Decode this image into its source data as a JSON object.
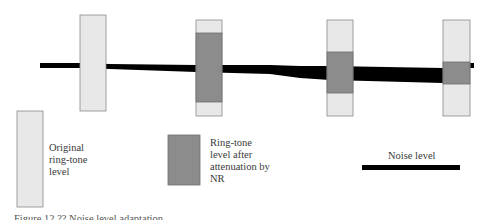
{
  "diagram": {
    "colors": {
      "original_fill": "#e8e8e8",
      "original_stroke": "#8a8a8a",
      "attenuated_fill": "#8c8c8c",
      "attenuated_stroke": "#6e6e6e",
      "noise": "#000000"
    },
    "stages": [
      {
        "id": "stage-1",
        "original_level": 1.0,
        "attenuated_level": null,
        "noise_thickness": "thin"
      },
      {
        "id": "stage-2",
        "original_level": 1.0,
        "attenuated_level": 0.72,
        "noise_thickness": "medium"
      },
      {
        "id": "stage-3",
        "original_level": 1.0,
        "attenuated_level": 0.42,
        "noise_thickness": "thick"
      },
      {
        "id": "stage-4",
        "original_level": 1.0,
        "attenuated_level": 0.23,
        "noise_thickness": "thickest"
      }
    ]
  },
  "legend": {
    "original": "Original ring-tone level",
    "original_lines": [
      "Original",
      "ring-tone",
      "level"
    ],
    "attenuated": "Ring-tone level after attenuation by NR",
    "attenuated_lines": [
      "Ring-tone",
      "level after",
      "attenuation by",
      "NR"
    ],
    "noise": "Noise level"
  },
  "caption": "Figure 12.?? Noise level adaptation"
}
